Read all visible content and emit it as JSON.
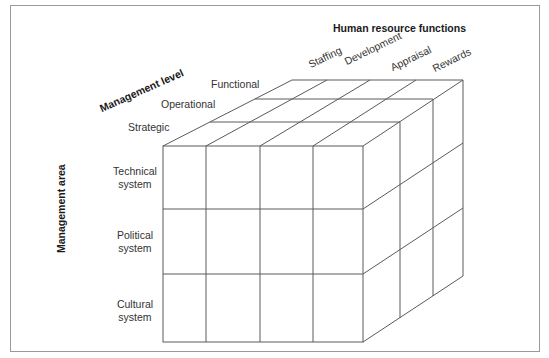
{
  "diagram": {
    "title": "Human resource functions",
    "axes": {
      "functions_title": "Human resource functions",
      "level_title": "Management level",
      "area_title": "Management area"
    },
    "functions": [
      "Staffing",
      "Development",
      "Appraisal",
      "Rewards"
    ],
    "levels": [
      "Strategic",
      "Operational",
      "Functional"
    ],
    "areas": [
      {
        "line1": "Technical",
        "line2": "system"
      },
      {
        "line1": "Political",
        "line2": "system"
      },
      {
        "line1": "Cultural",
        "line2": "system"
      }
    ],
    "colors": {
      "line": "#555555",
      "frame": "#9a9a9a",
      "text": "#333333"
    }
  }
}
